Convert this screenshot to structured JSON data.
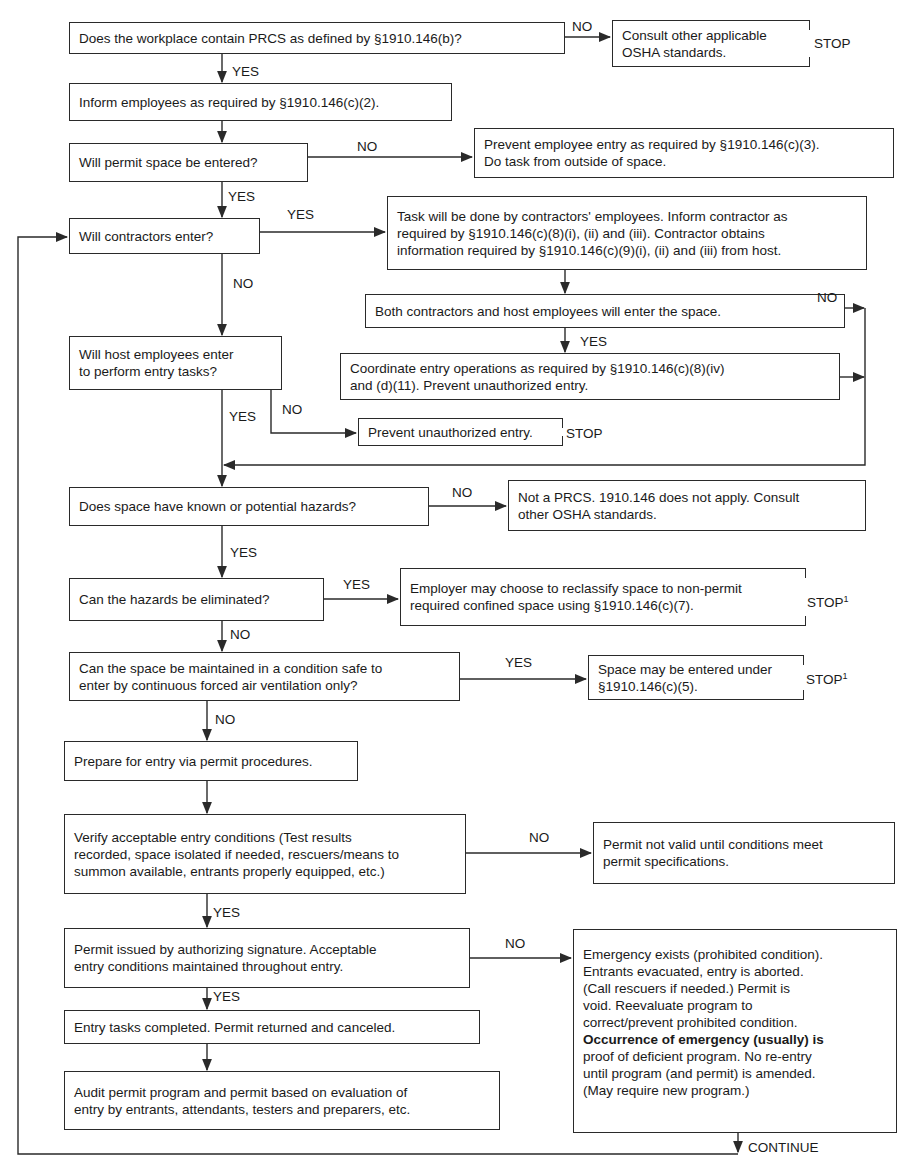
{
  "diagram": {
    "type": "flowchart",
    "colors": {
      "line": "#2a2a2a",
      "text": "#1a1a1a",
      "background": "#ffffff"
    },
    "nodes": {
      "n1": {
        "text": "Does the workplace contain PRCS as defined by §1910.146(b)?"
      },
      "n2": {
        "text": "Consult other applicable\nOSHA standards.",
        "terminal": "STOP"
      },
      "n3": {
        "text": "Inform employees as required by §1910.146(c)(2)."
      },
      "n4": {
        "text": "Will permit space be entered?"
      },
      "n5": {
        "text": "Prevent employee entry as required by §1910.146(c)(3).\nDo task from outside of space."
      },
      "n6": {
        "text": "Will contractors enter?"
      },
      "n7": {
        "text": "Task will be done by contractors' employees.  Inform contractor as\nrequired by §1910.146(c)(8)(i), (ii) and (iii).  Contractor obtains\ninformation required by §1910.146(c)(9)(i), (ii) and (iii) from host."
      },
      "n8": {
        "text": "Both contractors and host employees will enter the space."
      },
      "n9": {
        "text": "Will host employees enter\nto perform entry tasks?"
      },
      "n10": {
        "text": "Coordinate entry operations as required by §1910.146(c)(8)(iv)\nand (d)(11).  Prevent unauthorized entry."
      },
      "n11": {
        "text": "Prevent unauthorized entry.",
        "terminal": "STOP"
      },
      "n12": {
        "text": "Does space have known or potential hazards?"
      },
      "n13": {
        "text": "Not a PRCS.  1910.146 does not apply.  Consult\nother OSHA standards."
      },
      "n14": {
        "text": "Can the hazards be eliminated?"
      },
      "n15": {
        "text": "Employer may choose to reclassify space to non-permit\nrequired confined space using §1910.146(c)(7).",
        "terminal": "STOP",
        "footnote": "1"
      },
      "n16": {
        "text": "Can the space be maintained in a condition safe to\nenter by continuous forced air ventilation only?"
      },
      "n17": {
        "text": "Space may be entered under\n§1910.146(c)(5).",
        "terminal": "STOP",
        "footnote": "1"
      },
      "n18": {
        "text": "Prepare for entry via permit procedures."
      },
      "n19": {
        "text": "Verify acceptable entry conditions (Test results\nrecorded, space isolated if needed, rescuers/means to\nsummon available, entrants properly equipped, etc.)"
      },
      "n20": {
        "text": "Permit not valid until conditions meet\npermit specifications."
      },
      "n21": {
        "text": "Permit issued by authorizing signature.  Acceptable\nentry conditions maintained throughout entry."
      },
      "n22": {
        "text": "Entry tasks completed.  Permit returned and canceled."
      },
      "n23": {
        "text": "Audit permit program and permit based on evaluation of\nentry by entrants, attendants, testers and preparers, etc."
      },
      "n24": {
        "text_a": "Emergency exists (prohibited condition).\nEntrants evacuated, entry is aborted.\n(Call rescuers if needed.)  Permit is\nvoid.  Reevaluate program to\ncorrect/prevent prohibited condition.",
        "text_b": "Occurrence of emergency (usually) is",
        "text_c": "proof of deficient program.  No re-entry\nuntil program (and permit) is amended.\n(May require new program.)"
      }
    },
    "edge_labels": {
      "n1_n2": "NO",
      "n1_n3": "YES",
      "n4_n5": "NO",
      "n4_n6": "YES",
      "n6_n7": "YES",
      "n6_n9": "NO",
      "n8_merge": "NO",
      "n8_n10": "YES",
      "n9_n12": "YES",
      "n9_n11": "NO",
      "n12_n13": "NO",
      "n12_n14": "YES",
      "n14_n15": "YES",
      "n14_n16": "NO",
      "n16_n17": "YES",
      "n16_n18": "NO",
      "n19_n20": "NO",
      "n19_n21": "YES",
      "n21_n24": "NO",
      "n21_n22": "YES",
      "n24_loop": "CONTINUE"
    },
    "terminals": {
      "stop": "STOP",
      "footnote": "1"
    },
    "edges": [
      [
        "n1",
        "n2",
        "NO"
      ],
      [
        "n1",
        "n3",
        "YES"
      ],
      [
        "n3",
        "n4",
        ""
      ],
      [
        "n4",
        "n5",
        "NO"
      ],
      [
        "n4",
        "n6",
        "YES"
      ],
      [
        "n6",
        "n7",
        "YES"
      ],
      [
        "n6",
        "n9",
        "NO"
      ],
      [
        "n7",
        "n8",
        ""
      ],
      [
        "n8",
        "n10",
        "YES"
      ],
      [
        "n8",
        "n12",
        "NO"
      ],
      [
        "n10",
        "n12",
        ""
      ],
      [
        "n9",
        "n12",
        "YES"
      ],
      [
        "n9",
        "n11",
        "NO"
      ],
      [
        "n12",
        "n13",
        "NO"
      ],
      [
        "n12",
        "n14",
        "YES"
      ],
      [
        "n14",
        "n15",
        "YES"
      ],
      [
        "n14",
        "n16",
        "NO"
      ],
      [
        "n16",
        "n17",
        "YES"
      ],
      [
        "n16",
        "n18",
        "NO"
      ],
      [
        "n18",
        "n19",
        ""
      ],
      [
        "n19",
        "n20",
        "NO"
      ],
      [
        "n19",
        "n21",
        "YES"
      ],
      [
        "n21",
        "n24",
        "NO"
      ],
      [
        "n21",
        "n22",
        "YES"
      ],
      [
        "n22",
        "n23",
        ""
      ],
      [
        "n23",
        "n6",
        ""
      ],
      [
        "n24",
        "n6",
        "CONTINUE"
      ]
    ]
  }
}
